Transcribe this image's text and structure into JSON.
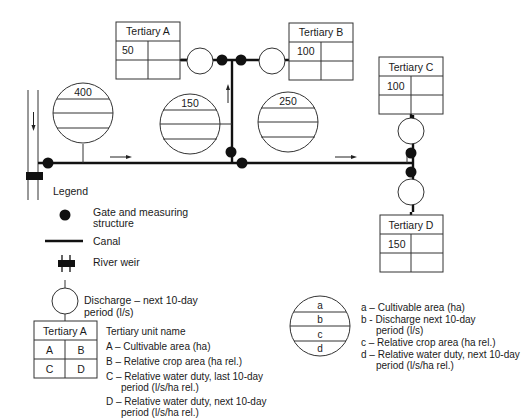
{
  "diagram": {
    "tertiary_units": [
      {
        "name": "Tertiary A",
        "a": "50",
        "b": "",
        "c": "",
        "d": ""
      },
      {
        "name": "Tertiary B",
        "a": "100",
        "b": "",
        "c": "",
        "d": ""
      },
      {
        "name": "Tertiary C",
        "a": "100",
        "b": "",
        "c": "",
        "d": ""
      },
      {
        "name": "Tertiary D",
        "a": "150",
        "b": "",
        "c": "",
        "d": ""
      }
    ],
    "secondary_units": [
      {
        "a": "400"
      },
      {
        "a": "150"
      },
      {
        "a": "250"
      }
    ]
  },
  "legend": {
    "title": "Legend",
    "gate": [
      "Gate and measuring",
      "structure"
    ],
    "canal": "Canal",
    "weir": "River weir",
    "discharge": [
      "Discharge – next 10-day",
      "period (l/s)"
    ],
    "tertiary_sample": {
      "name": "Tertiary A",
      "a": "A",
      "b": "B",
      "c": "C",
      "d": "D"
    },
    "tertiary_desc": [
      "Tertiary unit name",
      "A – Cultivable area (ha)",
      "B – Relative crop area (ha rel.)",
      "C – Relative water duty, last 10-day",
      "period (l/s/ha rel.)",
      "D – Relative water duty, next 10-day",
      "period (l/s/ha rel.)"
    ],
    "secondary_sample": {
      "a": "a",
      "b": "b",
      "c": "c",
      "d": "d"
    },
    "secondary_desc": [
      "a – Cultivable area (ha)",
      "b - Discharge next 10-day",
      "period (l/s)",
      "c – Relative crop area (ha rel.)",
      "d – Relative water duty, next 10-day",
      "period (l/s/ha rel.)"
    ]
  }
}
